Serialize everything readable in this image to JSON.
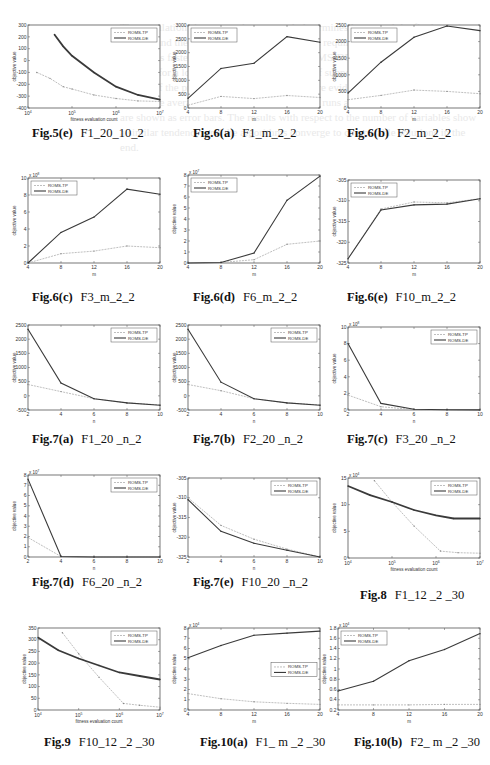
{
  "legend": {
    "tp": "ROMS-TP",
    "de": "ROMS-DE"
  },
  "colors": {
    "tp": "#b8b8b8",
    "de": "#3a3a3a",
    "axis": "#555555"
  },
  "chart_data": [
    {
      "id": "fig5e",
      "caption_label": "Fig.5(e)",
      "caption_rest": "F1_20_10_2",
      "type": "line",
      "xlabel": "fitness evaluation count",
      "ylabel": "objective value",
      "xscale": "log",
      "xlim": [
        4,
        7
      ],
      "ylim": [
        -400,
        300
      ],
      "yticks": [
        -400,
        -300,
        -200,
        -100,
        0,
        100,
        200,
        300
      ],
      "xtick_labels": [
        "10^4",
        "10^5",
        "10^6",
        "10^7"
      ],
      "legend_pos": "upper-right",
      "series": [
        {
          "name": "ROMS-TP",
          "x": [
            4.2,
            4.5,
            4.8,
            5.0,
            5.5,
            6.0,
            6.5,
            7.0
          ],
          "y": [
            -100,
            -150,
            -220,
            -240,
            -290,
            -320,
            -340,
            -345
          ]
        },
        {
          "name": "ROMS-DE",
          "x": [
            4.6,
            4.8,
            5.0,
            5.5,
            6.0,
            6.5,
            7.0
          ],
          "y": [
            220,
            120,
            40,
            -100,
            -220,
            -290,
            -330
          ]
        }
      ]
    },
    {
      "id": "fig6a",
      "caption_label": "Fig.6(a)",
      "caption_rest": "F1_m_2_2",
      "type": "line",
      "xlabel": "m",
      "ylabel": "objective value",
      "xlim": [
        4,
        20
      ],
      "ylim": [
        0,
        3000
      ],
      "xticks": [
        4,
        8,
        12,
        16,
        20
      ],
      "yticks": [
        0,
        500,
        1000,
        1500,
        2000,
        2500,
        3000
      ],
      "legend_pos": "upper-left",
      "series": [
        {
          "name": "ROMS-TP",
          "x": [
            4,
            8,
            12,
            16,
            20
          ],
          "y": [
            100,
            420,
            340,
            450,
            380
          ]
        },
        {
          "name": "ROMS-DE",
          "x": [
            4,
            8,
            12,
            16,
            20
          ],
          "y": [
            350,
            1430,
            1620,
            2580,
            2380
          ]
        }
      ]
    },
    {
      "id": "fig6b",
      "caption_label": "Fig.6(b)",
      "caption_rest": "F2_m_2_2",
      "type": "line",
      "xlabel": "m",
      "ylabel": "objective value",
      "xlim": [
        4,
        20
      ],
      "ylim": [
        0,
        2500
      ],
      "xticks": [
        4,
        8,
        12,
        16,
        20
      ],
      "yticks": [
        0,
        500,
        1000,
        1500,
        2000,
        2500
      ],
      "legend_pos": "upper-left",
      "series": [
        {
          "name": "ROMS-TP",
          "x": [
            4,
            8,
            12,
            16,
            20
          ],
          "y": [
            250,
            380,
            540,
            500,
            430
          ]
        },
        {
          "name": "ROMS-DE",
          "x": [
            4,
            8,
            12,
            16,
            20
          ],
          "y": [
            450,
            1380,
            2130,
            2470,
            2330
          ]
        }
      ]
    },
    {
      "id": "fig6c",
      "caption_label": "Fig.6(c)",
      "caption_rest": "F3_m_2_2",
      "type": "line",
      "xlabel": "m",
      "ylabel": "objective value",
      "y_multiplier": "x 10^8",
      "xlim": [
        4,
        20
      ],
      "ylim": [
        0,
        10
      ],
      "xticks": [
        4,
        8,
        12,
        16,
        20
      ],
      "yticks": [
        0,
        2,
        4,
        6,
        8,
        10
      ],
      "legend_pos": "upper-left",
      "series": [
        {
          "name": "ROMS-TP",
          "x": [
            4,
            8,
            12,
            16,
            20
          ],
          "y": [
            0,
            1.1,
            1.4,
            2.0,
            1.8
          ]
        },
        {
          "name": "ROMS-DE",
          "x": [
            4,
            8,
            12,
            16,
            20
          ],
          "y": [
            0,
            3.6,
            5.4,
            8.7,
            8.1
          ]
        }
      ]
    },
    {
      "id": "fig6d",
      "caption_label": "Fig.6(d)",
      "caption_rest": "F6_m_2_2",
      "type": "line",
      "xlabel": "m",
      "ylabel": "objective value",
      "y_multiplier": "x 10^7",
      "xlim": [
        4,
        20
      ],
      "ylim": [
        0,
        8
      ],
      "xticks": [
        4,
        8,
        12,
        16,
        20
      ],
      "yticks": [
        0,
        1,
        2,
        3,
        4,
        5,
        6,
        7,
        8
      ],
      "legend_pos": "upper-left",
      "series": [
        {
          "name": "ROMS-TP",
          "x": [
            4,
            8,
            12,
            16,
            20
          ],
          "y": [
            0,
            0.05,
            0.3,
            1.7,
            2.0
          ]
        },
        {
          "name": "ROMS-DE",
          "x": [
            4,
            8,
            12,
            16,
            20
          ],
          "y": [
            0,
            0.05,
            0.9,
            5.7,
            7.9
          ]
        }
      ]
    },
    {
      "id": "fig6e",
      "caption_label": "Fig.6(e)",
      "caption_rest": "F10_m_2_2",
      "type": "line",
      "xlabel": "m",
      "ylabel": "objective value",
      "xlim": [
        4,
        20
      ],
      "ylim": [
        -325,
        -305
      ],
      "xticks": [
        4,
        8,
        12,
        16,
        20
      ],
      "yticks": [
        -325,
        -320,
        -315,
        -310,
        -305
      ],
      "legend_pos": "upper-left",
      "series": [
        {
          "name": "ROMS-TP",
          "x": [
            4,
            8,
            12,
            16,
            20
          ],
          "y": [
            -324,
            -312,
            -310.3,
            -310.5,
            -309.5
          ]
        },
        {
          "name": "ROMS-DE",
          "x": [
            4,
            8,
            12,
            16,
            20
          ],
          "y": [
            -324,
            -312.2,
            -311,
            -310.8,
            -309.5
          ]
        }
      ]
    },
    {
      "id": "fig7a",
      "caption_label": "Fig.7(a)",
      "caption_rest": "F1_20 _n_2",
      "type": "line",
      "xlabel": "n",
      "ylabel": "objective value",
      "xlim": [
        2,
        10
      ],
      "ylim": [
        -500,
        2500
      ],
      "xticks": [
        2,
        4,
        6,
        8,
        10
      ],
      "yticks": [
        -500,
        0,
        500,
        1000,
        1500,
        2000,
        2500
      ],
      "legend_pos": "upper-right",
      "series": [
        {
          "name": "ROMS-TP",
          "x": [
            2,
            4,
            6,
            8,
            10
          ],
          "y": [
            400,
            150,
            -100,
            -250,
            -320
          ]
        },
        {
          "name": "ROMS-DE",
          "x": [
            2,
            4,
            6,
            8,
            10
          ],
          "y": [
            2350,
            450,
            -100,
            -250,
            -330
          ]
        }
      ]
    },
    {
      "id": "fig7b",
      "caption_label": "Fig.7(b)",
      "caption_rest": "F2_20 _n_2",
      "type": "line",
      "xlabel": "n",
      "ylabel": "objective value",
      "xlim": [
        2,
        10
      ],
      "ylim": [
        -500,
        2500
      ],
      "xticks": [
        2,
        4,
        6,
        8,
        10
      ],
      "yticks": [
        -500,
        0,
        500,
        1000,
        1500,
        2000,
        2500
      ],
      "legend_pos": "upper-right",
      "series": [
        {
          "name": "ROMS-TP",
          "x": [
            2,
            4,
            6,
            8,
            10
          ],
          "y": [
            400,
            180,
            -100,
            -250,
            -320
          ]
        },
        {
          "name": "ROMS-DE",
          "x": [
            2,
            4,
            6,
            8,
            10
          ],
          "y": [
            2350,
            480,
            -100,
            -250,
            -330
          ]
        }
      ]
    },
    {
      "id": "fig7c",
      "caption_label": "Fig.7(c)",
      "caption_rest": "F3_20 _n_2",
      "type": "line",
      "xlabel": "n",
      "ylabel": "objective value",
      "y_multiplier": "x 10^8",
      "xlim": [
        2,
        10
      ],
      "ylim": [
        0,
        10
      ],
      "xticks": [
        2,
        4,
        6,
        8,
        10
      ],
      "yticks": [
        0,
        2,
        4,
        6,
        8,
        10
      ],
      "legend_pos": "upper-right",
      "series": [
        {
          "name": "ROMS-TP",
          "x": [
            2,
            4,
            6,
            8,
            10
          ],
          "y": [
            1.8,
            0.4,
            0.05,
            0.02,
            0.01
          ]
        },
        {
          "name": "ROMS-DE",
          "x": [
            2,
            4,
            6,
            8,
            10
          ],
          "y": [
            8.0,
            0.8,
            0.1,
            0.02,
            0.01
          ]
        }
      ]
    },
    {
      "id": "fig7d",
      "caption_label": "Fig.7(d)",
      "caption_rest": "F6_20 _n_2",
      "type": "line",
      "xlabel": "n",
      "ylabel": "objective value",
      "y_multiplier": "x 10^7",
      "xlim": [
        2,
        10
      ],
      "ylim": [
        0,
        8
      ],
      "xticks": [
        2,
        4,
        6,
        8,
        10
      ],
      "yticks": [
        0,
        1,
        2,
        3,
        4,
        5,
        6,
        7,
        8
      ],
      "legend_pos": "upper-right",
      "series": [
        {
          "name": "ROMS-TP",
          "x": [
            2,
            4,
            6,
            8,
            10
          ],
          "y": [
            1.9,
            0.05,
            0,
            0,
            0
          ]
        },
        {
          "name": "ROMS-DE",
          "x": [
            2,
            4,
            6,
            8,
            10
          ],
          "y": [
            7.6,
            0.05,
            0,
            0,
            0
          ]
        }
      ]
    },
    {
      "id": "fig7e",
      "caption_label": "Fig.7(e)",
      "caption_rest": "F10_20 _n_2",
      "type": "line",
      "xlabel": "n",
      "ylabel": "objective value",
      "xlim": [
        2,
        10
      ],
      "ylim": [
        -325,
        -305
      ],
      "xticks": [
        2,
        4,
        6,
        8,
        10
      ],
      "yticks": [
        -325,
        -320,
        -315,
        -310,
        -305
      ],
      "legend_pos": "upper-right",
      "series": [
        {
          "name": "ROMS-TP",
          "x": [
            2,
            4,
            6,
            8,
            10
          ],
          "y": [
            -310,
            -317,
            -320.5,
            -323,
            -325
          ]
        },
        {
          "name": "ROMS-DE",
          "x": [
            2,
            4,
            6,
            8,
            10
          ],
          "y": [
            -310.5,
            -318.5,
            -321.5,
            -323.3,
            -325
          ]
        }
      ]
    },
    {
      "id": "fig8",
      "caption_label": "Fig.8",
      "caption_rest": "F1_12 _2 _30",
      "type": "line",
      "xlabel": "fitness evaluation count",
      "ylabel": "objective value",
      "y_multiplier": "x 10^4",
      "xscale": "log",
      "xlim": [
        4,
        7
      ],
      "ylim": [
        0,
        15
      ],
      "yticks": [
        0,
        5,
        10,
        15
      ],
      "xtick_labels": [
        "10^4",
        "10^5",
        "10^6",
        "10^7"
      ],
      "legend_pos": "upper-right",
      "series": [
        {
          "name": "ROMS-TP",
          "x": [
            4.6,
            5.0,
            5.5,
            6.1,
            6.5,
            7.0
          ],
          "y": [
            14.5,
            10.5,
            6.0,
            1.3,
            1.0,
            0.9
          ]
        },
        {
          "name": "ROMS-DE",
          "x": [
            4.0,
            4.5,
            5.0,
            5.5,
            6.0,
            6.4,
            7.0
          ],
          "y": [
            13.5,
            11.8,
            10.5,
            9.0,
            8.0,
            7.4,
            7.4
          ]
        }
      ]
    },
    {
      "id": "fig9",
      "caption_label": "Fig.9",
      "caption_rest": "F10_12 _2 _30",
      "type": "line",
      "xlabel": "fitness evaluation count",
      "ylabel": "objective value",
      "xscale": "log",
      "xlim": [
        4,
        7
      ],
      "ylim": [
        0,
        350
      ],
      "yticks": [
        0,
        50,
        100,
        150,
        200,
        250,
        300,
        350
      ],
      "xtick_labels": [
        "10^4",
        "10^5",
        "10^6",
        "10^7"
      ],
      "legend_pos": "upper-right",
      "series": [
        {
          "name": "ROMS-TP",
          "x": [
            4.6,
            5.0,
            5.5,
            6.1,
            6.5,
            7.0
          ],
          "y": [
            330,
            240,
            140,
            28,
            20,
            12
          ]
        },
        {
          "name": "ROMS-DE",
          "x": [
            4.0,
            4.5,
            5.0,
            5.5,
            6.0,
            6.5,
            7.0
          ],
          "y": [
            310,
            255,
            220,
            190,
            160,
            145,
            130
          ]
        }
      ]
    },
    {
      "id": "fig10a",
      "caption_label": "Fig.10(a)",
      "caption_rest": "F1_ m _2 _30",
      "type": "line",
      "xlabel": "m",
      "ylabel": "objective value",
      "y_multiplier": "x 10^4",
      "xlim": [
        4,
        20
      ],
      "ylim": [
        0,
        8
      ],
      "xticks": [
        4,
        8,
        12,
        16,
        20
      ],
      "yticks": [
        0,
        1,
        2,
        3,
        4,
        5,
        6,
        7,
        8
      ],
      "legend_pos": "center-right",
      "series": [
        {
          "name": "ROMS-TP",
          "x": [
            4,
            8,
            12,
            16,
            20
          ],
          "y": [
            1.6,
            1.1,
            0.8,
            0.65,
            0.55
          ]
        },
        {
          "name": "ROMS-DE",
          "x": [
            4,
            8,
            12,
            16,
            20
          ],
          "y": [
            5.1,
            6.3,
            7.3,
            7.5,
            7.7
          ]
        }
      ]
    },
    {
      "id": "fig10b",
      "caption_label": "Fig.10(b)",
      "caption_rest": "F2_ m _2 _30",
      "type": "line",
      "xlabel": "m",
      "ylabel": "objective value",
      "y_multiplier": "x 10^4",
      "xlim": [
        4,
        20
      ],
      "ylim": [
        0.2,
        1.8
      ],
      "xticks": [
        4,
        8,
        12,
        16,
        20
      ],
      "yticks": [
        0.2,
        0.4,
        0.6,
        0.8,
        1,
        1.2,
        1.4,
        1.6,
        1.8
      ],
      "legend_pos": "upper-left",
      "series": [
        {
          "name": "ROMS-TP",
          "x": [
            4,
            8,
            12,
            16,
            20
          ],
          "y": [
            0.3,
            0.3,
            0.3,
            0.31,
            0.31
          ]
        },
        {
          "name": "ROMS-DE",
          "x": [
            4,
            8,
            12,
            16,
            20
          ],
          "y": [
            0.57,
            0.76,
            1.16,
            1.38,
            1.69
          ]
        }
      ]
    }
  ],
  "layout": [
    {
      "chart": 0,
      "left": 28,
      "top": 25,
      "w": 132,
      "h": 83,
      "cap_x": 32,
      "cap_y": 126
    },
    {
      "chart": 1,
      "left": 188,
      "top": 25,
      "w": 132,
      "h": 83,
      "cap_x": 193,
      "cap_y": 126
    },
    {
      "chart": 2,
      "left": 348,
      "top": 25,
      "w": 132,
      "h": 83,
      "cap_x": 347,
      "cap_y": 126
    },
    {
      "chart": 3,
      "left": 28,
      "top": 178,
      "w": 132,
      "h": 85,
      "cap_x": 32,
      "cap_y": 290
    },
    {
      "chart": 4,
      "left": 188,
      "top": 175,
      "w": 132,
      "h": 88,
      "cap_x": 193,
      "cap_y": 290
    },
    {
      "chart": 5,
      "left": 348,
      "top": 180,
      "w": 132,
      "h": 83,
      "cap_x": 347,
      "cap_y": 290
    },
    {
      "chart": 6,
      "left": 28,
      "top": 325,
      "w": 132,
      "h": 85,
      "cap_x": 32,
      "cap_y": 432
    },
    {
      "chart": 7,
      "left": 188,
      "top": 325,
      "w": 132,
      "h": 85,
      "cap_x": 193,
      "cap_y": 432
    },
    {
      "chart": 8,
      "left": 348,
      "top": 327,
      "w": 132,
      "h": 83,
      "cap_x": 347,
      "cap_y": 432
    },
    {
      "chart": 9,
      "left": 28,
      "top": 475,
      "w": 132,
      "h": 82,
      "cap_x": 32,
      "cap_y": 575
    },
    {
      "chart": 10,
      "left": 188,
      "top": 478,
      "w": 132,
      "h": 79,
      "cap_x": 193,
      "cap_y": 575
    },
    {
      "chart": 11,
      "left": 348,
      "top": 478,
      "w": 132,
      "h": 80,
      "cap_x": 360,
      "cap_y": 588
    },
    {
      "chart": 12,
      "left": 38,
      "top": 628,
      "w": 122,
      "h": 82,
      "cap_x": 44,
      "cap_y": 735
    },
    {
      "chart": 13,
      "left": 188,
      "top": 628,
      "w": 132,
      "h": 82,
      "cap_x": 200,
      "cap_y": 735
    },
    {
      "chart": 14,
      "left": 338,
      "top": 628,
      "w": 142,
      "h": 82,
      "cap_x": 354,
      "cap_y": 735
    }
  ],
  "background_text": "The population size, as can be expected, determines how good the final solution will be, and the number of fitness evaluations required is related. ROMS-TP converges faster in the early stage, while ROMS-DE keeps improving the solution for a longer period. As the number of subpopulations increases, the benefit of the proposed strategy becomes more evident. Note that the objective values are averaged over several independent runs and the standard deviations are shown as error bars. The results with respect to the number of variables show a similar tendency, and the algorithms converge to comparable solutions in the end."
}
